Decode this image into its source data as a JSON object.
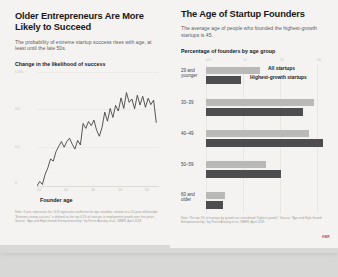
{
  "left_panel": {
    "title": "Older Entrepreneurs Are More Likely to Succeed",
    "subtitle": "The probability of extreme startup success rises with age, at least until the late 50s.",
    "kicker": "Change in the likelihood of success",
    "xaxis_title": "Founder age",
    "footnote": "Note: X axis represents the OLS regression coefficient for age variables, relative to a 20-year-old founder. \"Extreme startup success\" is defined as the top 0.1% of startups in employment growth over five years. Source: \"Age and High-Growth Entrepreneurship,\" by Pierre Azoulay et al., NBER, April 2018."
  },
  "right_panel": {
    "title": "The Age of Startup Founders",
    "subtitle": "The average age of people who founded the highest-growth startups is 45.",
    "kicker": "Percentage of founders by age group",
    "footnote": "Note: The top 1% of startups by growth are considered \"highest growth.\" Source: \"Age and High-Growth Entrepreneurship,\" by Pierre Azoulay et al., NBER, April 2018.",
    "brand": "HBR"
  },
  "chart_data": [
    {
      "type": "line",
      "title": "Change in the likelihood of success",
      "xlabel": "Founder age",
      "ylabel": "",
      "xlim": [
        20,
        65
      ],
      "ylim": [
        0,
        0.3
      ],
      "grid": true,
      "ytick_labels": [
        "0.3%",
        "0.2",
        "0.1",
        "0"
      ],
      "ytick_values": [
        0.3,
        0.2,
        0.1,
        0
      ],
      "xtick_labels": [
        "20",
        "30",
        "40",
        "50",
        "60"
      ],
      "xtick_values": [
        20,
        30,
        40,
        50,
        60
      ],
      "x": [
        20,
        21,
        22,
        23,
        24,
        25,
        26,
        27,
        28,
        29,
        30,
        31,
        32,
        33,
        34,
        35,
        36,
        37,
        38,
        39,
        40,
        41,
        42,
        43,
        44,
        45,
        46,
        47,
        48,
        49,
        50,
        51,
        52,
        53,
        54,
        55,
        56,
        57,
        58,
        59,
        60,
        61,
        62,
        63,
        64
      ],
      "values": [
        0.0,
        0.012,
        0.004,
        0.031,
        0.048,
        0.072,
        0.066,
        0.091,
        0.105,
        0.118,
        0.103,
        0.118,
        0.127,
        0.111,
        0.098,
        0.121,
        0.109,
        0.166,
        0.153,
        0.171,
        0.16,
        0.175,
        0.148,
        0.132,
        0.156,
        0.196,
        0.172,
        0.206,
        0.182,
        0.214,
        0.199,
        0.234,
        0.206,
        0.248,
        0.222,
        0.231,
        0.205,
        0.241,
        0.215,
        0.238,
        0.209,
        0.233,
        0.216,
        0.228,
        0.168
      ]
    },
    {
      "type": "bar",
      "orientation": "horizontal",
      "title": "Percentage of founders by age group",
      "xlim": [
        0,
        33
      ],
      "grid": true,
      "xtick_labels": [
        "0%",
        "10",
        "20",
        "30"
      ],
      "xtick_values": [
        0,
        10,
        20,
        30
      ],
      "categories": [
        "29 and younger",
        "30–39",
        "40–49",
        "50–59",
        "60 and older"
      ],
      "legend_position": "top-right",
      "series": [
        {
          "name": "All startups",
          "color": "#b9b9b7",
          "values": [
            14.5,
            29.0,
            27.5,
            16.0,
            5.0
          ]
        },
        {
          "name": "Highest-growth startups",
          "color": "#4d4d4f",
          "values": [
            9.5,
            26.0,
            31.5,
            20.0,
            4.5
          ]
        }
      ]
    }
  ]
}
